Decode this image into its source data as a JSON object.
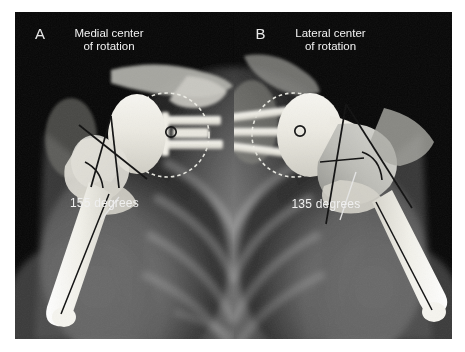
{
  "figure": {
    "background": "#ffffff",
    "frame_color": "#050505",
    "annotation_text_color": "#f2f2f2",
    "line_color": "#111111",
    "leader_color": "#e6e6e6",
    "implant_color": "#f0efe9",
    "panels": [
      {
        "id": "A",
        "letter": "A",
        "caption": "Medial center\nof rotation",
        "angle_label": "155 degrees",
        "center_of_rotation": "medial",
        "marker": "small-circle"
      },
      {
        "id": "B",
        "letter": "B",
        "caption": "Lateral center\nof rotation",
        "angle_label": "135 degrees",
        "center_of_rotation": "lateral",
        "marker": "small-circle"
      }
    ]
  }
}
